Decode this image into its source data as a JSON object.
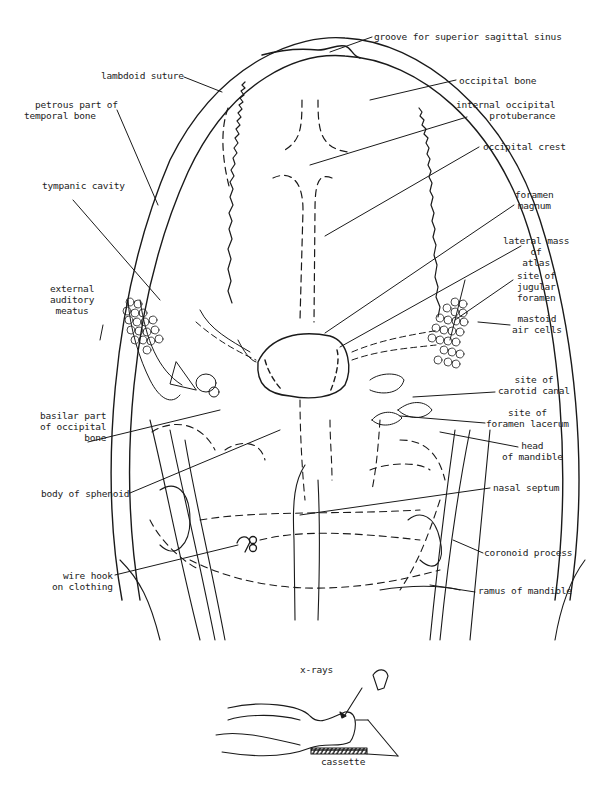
{
  "figure": {
    "labels_left": [
      {
        "id": "lambdoid-suture",
        "text": "lambdoid suture"
      },
      {
        "id": "petrous-temporal",
        "text": "petrous part of\ntemporal bone"
      },
      {
        "id": "tympanic-cavity",
        "text": "tympanic cavity"
      },
      {
        "id": "external-auditory-meatus",
        "text": "external\nauditory\nmeatus"
      },
      {
        "id": "basilar-occipital",
        "text": "basilar part\nof occipital\nbone"
      },
      {
        "id": "body-of-sphenoid",
        "text": "body of sphenoid"
      },
      {
        "id": "wire-hook",
        "text": "wire hook\non clothing"
      }
    ],
    "labels_right": [
      {
        "id": "groove-sagittal-sinus",
        "text": "groove for superior sagittal sinus"
      },
      {
        "id": "occipital-bone",
        "text": "occipital bone"
      },
      {
        "id": "internal-occipital-protuberance",
        "text": "internal occipital\nprotuberance"
      },
      {
        "id": "occipital-crest",
        "text": "occipital crest"
      },
      {
        "id": "foramen-magnum",
        "text": "foramen\nmagnum"
      },
      {
        "id": "lateral-mass-atlas",
        "text": "lateral mass\nof\natlas"
      },
      {
        "id": "jugular-foramen",
        "text": "site of\njugular\nforamen"
      },
      {
        "id": "mastoid-air-cells",
        "text": "mastoid\nair cells"
      },
      {
        "id": "carotid-canal",
        "text": "site of\ncarotid canal"
      },
      {
        "id": "foramen-lacerum",
        "text": "site of\nforamen lacerum"
      },
      {
        "id": "head-of-mandible",
        "text": "head\nof mandible"
      },
      {
        "id": "nasal-septum",
        "text": "nasal septum"
      },
      {
        "id": "coronoid-process",
        "text": "coronoid process"
      },
      {
        "id": "ramus-of-mandible",
        "text": "ramus of mandible"
      }
    ],
    "inset": {
      "xrays_label": "x-rays",
      "cassette_label": "cassette"
    },
    "colors": {
      "ink": "#1a1a1a",
      "paper": "#ffffff"
    }
  }
}
